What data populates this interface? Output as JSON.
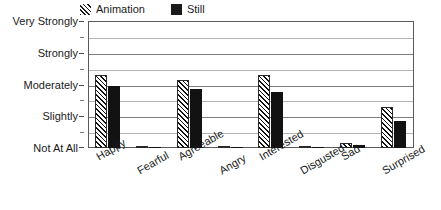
{
  "chart_data": {
    "type": "bar",
    "title": "",
    "subtitle": "",
    "xlabel": "",
    "ylabel": "",
    "categories": [
      "Happy",
      "Fearful",
      "Agreeable",
      "Angry",
      "Interested",
      "Disgusted",
      "Sad",
      "Surprised"
    ],
    "series": [
      {
        "name": "Animation",
        "pattern": "diagonal-hatch",
        "color": "#111111",
        "values": [
          2.3,
          0.04,
          2.15,
          0.04,
          2.3,
          0.04,
          0.15,
          1.3
        ]
      },
      {
        "name": "Still",
        "pattern": "solid",
        "color": "#121212",
        "values": [
          1.95,
          0.04,
          1.85,
          0.04,
          1.75,
          0.04,
          0.1,
          0.85
        ]
      }
    ],
    "ylim": [
      0,
      4
    ],
    "ytick_values": [
      0,
      1,
      2,
      3,
      4
    ],
    "ytick_labels": [
      "Not At All",
      "Slightly",
      "Moderately",
      "Strongly",
      "Very Strongly"
    ],
    "yminor_values": [
      0.5,
      1.5,
      2.5,
      3.5
    ],
    "grid": true,
    "grid_minor": true,
    "legend_position": "top"
  },
  "legend": {
    "items": [
      {
        "label": "Animation",
        "swatch": "hatched-swatch"
      },
      {
        "label": "Still",
        "swatch": "solid-swatch"
      }
    ]
  },
  "axes": {
    "y": {
      "labels": [
        "Very Strongly",
        "Strongly",
        "Moderately",
        "Slightly",
        "Not At All"
      ]
    },
    "x": {
      "labels": [
        "Happy",
        "Fearful",
        "Agreeable",
        "Angry",
        "Interested",
        "Disgusted",
        "Sad",
        "Surprised"
      ]
    }
  }
}
